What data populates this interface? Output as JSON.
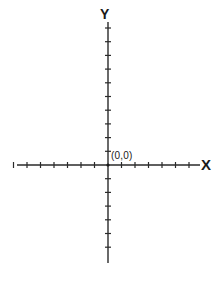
{
  "diagram": {
    "type": "cartesian-axes",
    "x_axis": {
      "label": "X",
      "negative_ticks": 7,
      "positive_ticks": 6
    },
    "y_axis": {
      "label": "Y",
      "positive_ticks": 10,
      "negative_ticks": 6
    },
    "origin": {
      "label": "(0,0)"
    },
    "colors": {
      "axis": "#2a2a2a",
      "background": "#ffffff"
    }
  }
}
